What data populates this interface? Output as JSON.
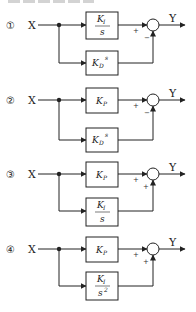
{
  "header": {
    "cropped_text": ""
  },
  "diagrams": [
    {
      "number": "①",
      "input": "X",
      "output": "Y",
      "top_block": {
        "type": "fraction",
        "num": "K",
        "num_sub": "I",
        "den": "s"
      },
      "bottom_block": {
        "type": "product",
        "main": "K",
        "sub": "D",
        "suffix": "s"
      },
      "top_sign": "+",
      "bottom_sign": "−"
    },
    {
      "number": "②",
      "input": "X",
      "output": "Y",
      "top_block": {
        "type": "gain",
        "main": "K",
        "sub": "P"
      },
      "bottom_block": {
        "type": "product",
        "main": "K",
        "sub": "D",
        "suffix": "s"
      },
      "top_sign": "+",
      "bottom_sign": "−"
    },
    {
      "number": "③",
      "input": "X",
      "output": "Y",
      "top_block": {
        "type": "gain",
        "main": "K",
        "sub": "P"
      },
      "bottom_block": {
        "type": "fraction",
        "num": "K",
        "num_sub": "I",
        "den": "s"
      },
      "top_sign": "+",
      "bottom_sign": "+"
    },
    {
      "number": "④",
      "input": "X",
      "output": "Y",
      "top_block": {
        "type": "gain",
        "main": "K",
        "sub": "P"
      },
      "bottom_block": {
        "type": "fraction",
        "num": "K",
        "num_sub": "I",
        "den": "s",
        "den_sup": "2"
      },
      "top_sign": "+",
      "bottom_sign": "+"
    }
  ]
}
